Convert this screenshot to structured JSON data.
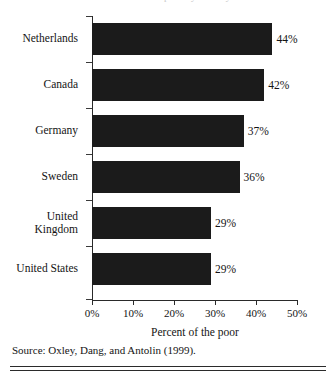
{
  "figure": {
    "title_remnant": "Percent of the poor by country",
    "source_note": "Source: Oxley, Dang, and Antolin (1999)."
  },
  "axis": {
    "x_title": "Percent of the poor",
    "x_ticks": [
      "0%",
      "10%",
      "20%",
      "30%",
      "40%",
      "50%"
    ]
  },
  "chart_data": {
    "type": "bar",
    "orientation": "horizontal",
    "title": "",
    "xlabel": "Percent of the poor",
    "ylabel": "",
    "xlim": [
      0,
      50
    ],
    "xtick_step": 10,
    "grid": false,
    "legend": false,
    "bar_color": "#1b1b1b",
    "categories": [
      "Netherlands",
      "Canada",
      "Germany",
      "Sweden",
      "United\nKingdom",
      "United States"
    ],
    "values": [
      44,
      42,
      37,
      36,
      29,
      29
    ],
    "value_labels": [
      "44%",
      "42%",
      "37%",
      "36%",
      "29%",
      "29%"
    ]
  }
}
